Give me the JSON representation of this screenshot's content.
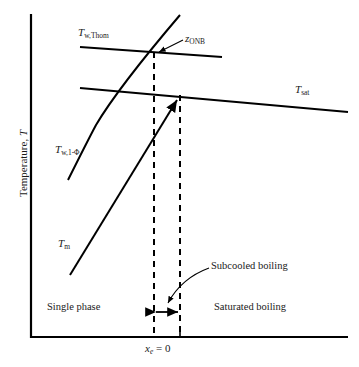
{
  "figure": {
    "background_color": "#ffffff",
    "line_color": "#000000",
    "text_color": "#1a1a1a"
  },
  "axes": {
    "y_title": "Temperature, T",
    "y_title_symbol": "T",
    "y_title_prefix": "Temperature, ",
    "x_tick_label": "x",
    "x_tick_sub": "e",
    "x_tick_value": " = 0",
    "frame": {
      "left": 31,
      "right": 348,
      "top": 14,
      "bottom": 337
    }
  },
  "curves": [
    {
      "name": "T_w,Thom",
      "label_prefix": "T",
      "label_sub": "w,Thom",
      "type": "line",
      "description": "Thom wall temperature, nearly horizontal with slight downward slope",
      "points": [
        [
          80,
          47
        ],
        [
          222,
          57
        ]
      ]
    },
    {
      "name": "T_sat",
      "label_prefix": "T",
      "label_sub": "sat",
      "type": "line",
      "description": "Saturation temperature, gentle downward slope to the right edge",
      "points": [
        [
          80,
          88
        ],
        [
          348,
          112
        ]
      ]
    },
    {
      "name": "T_w,1-phi",
      "label_prefix": "T",
      "label_sub": "w,1-Φ",
      "type": "curve",
      "description": "Single phase wall temperature, steeply rising curve crossing T_w,Thom at ONB",
      "points": [
        [
          68,
          180
        ],
        [
          96,
          125
        ],
        [
          130,
          80
        ],
        [
          156,
          49
        ],
        [
          180,
          15
        ]
      ]
    },
    {
      "name": "T_m",
      "label_prefix": "T",
      "label_sub": "m",
      "type": "line",
      "description": "Mean fluid temperature, straight rising line ending with arrowhead at T_sat",
      "points": [
        [
          70,
          275
        ],
        [
          180,
          95
        ]
      ],
      "arrowhead": true
    }
  ],
  "annotations": {
    "onb": {
      "label_prefix": "z",
      "label_sub": "ONB",
      "description": "Onset of nucleate boiling, arrow pointing to intersection of T_w,Thom and T_w,1-phi",
      "point": [
        155,
        52
      ]
    },
    "subcooled": {
      "text": "Subcooled boiling",
      "description": "Curved leader arrow pointing down-left to the subcooled boiling region"
    },
    "single_phase": {
      "text": "Single phase"
    },
    "saturated": {
      "text": "Saturated boiling"
    }
  },
  "dashed_lines": [
    {
      "name": "z-onb-vertical",
      "x": 154,
      "y_top": 52,
      "y_bottom": 337
    },
    {
      "name": "xe-zero-vertical",
      "x": 180,
      "y_top": 95,
      "y_bottom": 337
    }
  ],
  "span_arrow": {
    "name": "subcooled-boiling-span",
    "x_start": 154,
    "x_end": 180,
    "y": 312,
    "double_headed": true
  }
}
